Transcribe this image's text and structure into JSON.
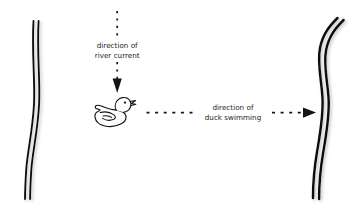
{
  "canvas": {
    "width": 363,
    "height": 217,
    "background_color": "#ffffff",
    "ink_color": "#141414",
    "text_color": "#1b1b1b"
  },
  "diagram": {
    "labels": {
      "current_line1": "direction of",
      "current_line2": "river current",
      "duck_line1": "direction of",
      "duck_line2": "duck swimming"
    },
    "arrows": [
      {
        "name": "river-current-arrow",
        "orientation": "vertical",
        "points_toward": "down",
        "style": "dashed",
        "label": "direction of river current"
      },
      {
        "name": "duck-swimming-arrow",
        "orientation": "horizontal",
        "points_toward": "right",
        "style": "dashed",
        "label": "direction of duck swimming"
      }
    ],
    "objects": [
      {
        "name": "left-riverbank",
        "type": "wavy-double-line"
      },
      {
        "name": "right-riverbank",
        "type": "wavy-double-line"
      },
      {
        "name": "duck",
        "type": "line-drawing"
      }
    ]
  }
}
